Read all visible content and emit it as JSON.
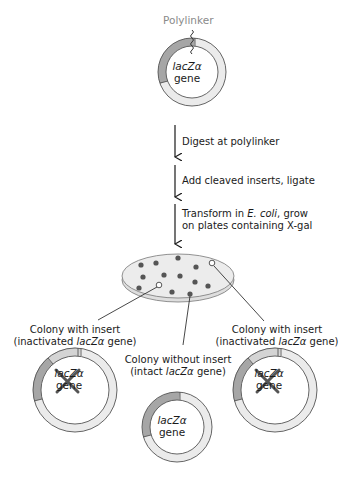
{
  "figure": {
    "top_plasmid": {
      "polylinker_label": "Polylinker",
      "gene_name": "lacZα",
      "gene_word": "gene"
    },
    "steps": [
      {
        "line1": "Digest at polylinker"
      },
      {
        "line1": "Add cleaved inserts, ligate"
      },
      {
        "line1_pre": "Transform in ",
        "line1_italic": "E. coli",
        "line1_post": ", grow",
        "line2": "on plates containing X-gal"
      }
    ],
    "plate": {
      "blue_colony_count": 13,
      "white_colony_count": 2
    },
    "outcomes": [
      {
        "title": "Colony with insert",
        "sub_pre": "(inactivated ",
        "sub_italic": "lacZα",
        "sub_post": " gene)",
        "gene_name": "lacZα",
        "gene_word": "gene",
        "inactivated": true
      },
      {
        "title": "Colony without insert",
        "sub_pre": "(intact ",
        "sub_italic": "lacZα",
        "sub_post": " gene)",
        "gene_name": "lacZα",
        "gene_word": "gene",
        "inactivated": false
      },
      {
        "title": "Colony with insert",
        "sub_pre": "(inactivated ",
        "sub_italic": "lacZα",
        "sub_post": " gene)",
        "gene_name": "lacZα",
        "gene_word": "gene",
        "inactivated": true
      }
    ],
    "colors": {
      "ring_fill": "#ebebeb",
      "lacz_arc": "#a6a6a6",
      "insert_fill": "#d4d4d4",
      "outline": "#555555",
      "blue_colony": "#555555",
      "plate_fill": "#ececec"
    }
  }
}
